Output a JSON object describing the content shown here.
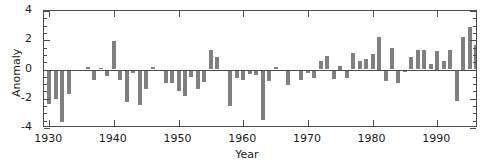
{
  "chart_data": {
    "type": "bar",
    "title": "",
    "subtitle": "",
    "xlabel": "Year",
    "ylabel": "Anomaly",
    "xlim": [
      1929.2,
      1996.3
    ],
    "ylim": [
      -4,
      4
    ],
    "yticks": [
      -4,
      -2,
      0,
      2,
      4
    ],
    "ytick_labels": [
      "-4",
      "-2",
      "0",
      "2",
      "4"
    ],
    "yminor_step": 0.5,
    "xticks": [
      1930,
      1940,
      1950,
      1960,
      1970,
      1980,
      1990
    ],
    "xtick_labels": [
      "1930",
      "1940",
      "1950",
      "1960",
      "1970",
      "1980",
      "1990"
    ],
    "grid": false,
    "legend": null,
    "bar_color": "#808080",
    "axis_color": "#4d4d4d",
    "bar_width_years": 0.62,
    "x": [
      1930,
      1931,
      1932,
      1933,
      1934,
      1935,
      1936,
      1937,
      1938,
      1939,
      1940,
      1941,
      1942,
      1943,
      1944,
      1945,
      1946,
      1947,
      1948,
      1949,
      1950,
      1951,
      1952,
      1953,
      1954,
      1955,
      1956,
      1957,
      1958,
      1959,
      1960,
      1961,
      1962,
      1963,
      1964,
      1965,
      1966,
      1967,
      1968,
      1969,
      1970,
      1971,
      1972,
      1973,
      1974,
      1975,
      1976,
      1977,
      1978,
      1979,
      1980,
      1981,
      1982,
      1983,
      1984,
      1985,
      1986,
      1987,
      1988,
      1989,
      1990,
      1991,
      1992,
      1993,
      1994,
      1995,
      1996
    ],
    "values": [
      -2.35,
      -2.05,
      -3.6,
      -1.65,
      -0.05,
      0.0,
      0.2,
      -0.75,
      0.1,
      -0.45,
      1.95,
      -0.7,
      -2.2,
      -0.25,
      -2.45,
      -1.35,
      0.15,
      -0.05,
      -0.95,
      -0.9,
      -1.5,
      -1.8,
      -0.5,
      -1.35,
      -0.85,
      1.3,
      0.85,
      -0.05,
      -2.5,
      -0.55,
      -0.75,
      -0.3,
      -0.4,
      -3.45,
      -0.8,
      0.15,
      -0.05,
      -1.05,
      -0.1,
      -0.75,
      -0.25,
      -0.6,
      0.6,
      0.9,
      -0.65,
      0.25,
      -0.55,
      1.15,
      0.55,
      0.7,
      1.05,
      2.25,
      -0.8,
      1.45,
      -0.95,
      -0.15,
      0.85,
      1.35,
      1.3,
      0.35,
      1.25,
      0.55,
      1.35,
      -2.15,
      2.25,
      2.9,
      1.65
    ]
  },
  "axes": {
    "left_spine": "y-axis",
    "bottom_spine": "x-axis"
  }
}
